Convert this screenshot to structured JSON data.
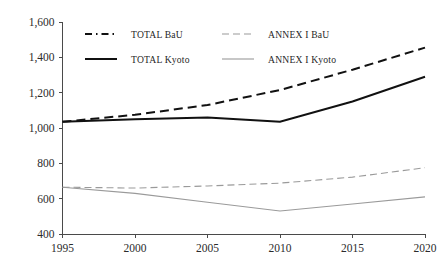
{
  "chart_data": {
    "type": "line",
    "title": "",
    "subtitle": "",
    "xlabel": "",
    "ylabel": "",
    "x": [
      1995,
      2000,
      2005,
      2010,
      2015,
      2020
    ],
    "xlim": [
      1995,
      2020
    ],
    "ylim": [
      400,
      1600
    ],
    "xticks": [
      "1995",
      "2000",
      "2005",
      "2010",
      "2015",
      "2020"
    ],
    "yticks": [
      "400",
      "600",
      "800",
      "1,000",
      "1,200",
      "1,400",
      "1,600"
    ],
    "ytick_values": [
      400,
      600,
      800,
      1000,
      1200,
      1400,
      1600
    ],
    "grid": false,
    "legend_position": "inside-top",
    "series": [
      {
        "name": "TOTAL BaU",
        "style": "dashed",
        "color": "#111111",
        "width": 2.0,
        "dasharray": "9,5",
        "legend_dasharray": "7,4,1.5,4",
        "values": [
          1035,
          1075,
          1130,
          1215,
          1330,
          1455
        ]
      },
      {
        "name": "ANNEX I BaU",
        "style": "dashed",
        "color": "#9a9a9a",
        "width": 1.1,
        "dasharray": "7,4",
        "legend_dasharray": "7,4",
        "values": [
          665,
          660,
          672,
          688,
          722,
          775
        ]
      },
      {
        "name": "TOTAL Kyoto",
        "style": "solid",
        "color": "#111111",
        "width": 2.0,
        "dasharray": "none",
        "legend_dasharray": "none",
        "values": [
          1035,
          1050,
          1060,
          1035,
          1150,
          1290
        ]
      },
      {
        "name": "ANNEX I Kyoto",
        "style": "solid",
        "color": "#9a9a9a",
        "width": 1.1,
        "dasharray": "none",
        "legend_dasharray": "none",
        "values": [
          665,
          630,
          580,
          530,
          570,
          610
        ]
      }
    ],
    "legend_entries": [
      {
        "label": "TOTAL BaU",
        "row": 0,
        "col": 0
      },
      {
        "label": "ANNEX I BaU",
        "row": 0,
        "col": 1
      },
      {
        "label": "TOTAL Kyoto",
        "row": 1,
        "col": 0
      },
      {
        "label": "ANNEX I Kyoto",
        "row": 1,
        "col": 1
      }
    ]
  },
  "colors": {
    "total": "#111111",
    "annex": "#9a9a9a",
    "axis": "#4a4a4a",
    "background": "#ffffff"
  }
}
